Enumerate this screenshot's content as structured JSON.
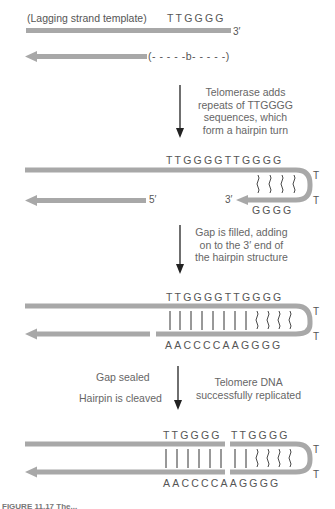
{
  "colors": {
    "strand": "#a8a8a8",
    "text": "#555555",
    "arrow": "#222222",
    "bond": "#333333"
  },
  "step1": {
    "template_label": "(Lagging strand template)",
    "template_seq": "TTGGGG",
    "three_prime": "3′",
    "gap_label": "(- - - - -b- - - - -)"
  },
  "arrow1": {
    "caption": [
      "Telomerase adds",
      "repeats of TTGGGG",
      "sequences, which",
      "form a hairpin turn"
    ]
  },
  "step2": {
    "top_seq": "TTGGGGTTGGGG",
    "bottom_seq": "GGGG",
    "five_prime": "5′",
    "three_prime": "3′",
    "loop_t1": "T",
    "loop_t2": "T"
  },
  "arrow2": {
    "caption": [
      "Gap is filled, adding",
      "on to the 3′ end of",
      "the hairpin structure"
    ]
  },
  "step3": {
    "top_seq": "TTGGGGTTGGGG",
    "bottom_seq": "AACCCCAAGGGG",
    "loop_t1": "T",
    "loop_t2": "T"
  },
  "arrow3": {
    "left_caption_1": "Gap sealed",
    "left_caption_2": "Hairpin is cleaved",
    "right_caption": [
      "Telomere DNA",
      "successfully replicated"
    ]
  },
  "step4": {
    "top_seq_a": "TTGGGG",
    "top_seq_b": "TTGGGG",
    "bottom_seq": "AACCCCAAGGGG",
    "loop_t1": "T",
    "loop_t2": "T"
  },
  "figure_caption": "FIGURE 11.17 The..."
}
